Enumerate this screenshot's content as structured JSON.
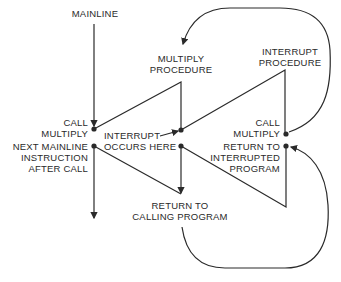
{
  "diagram": {
    "labels": {
      "mainline": "MAINLINE",
      "multiply_procedure": [
        "MULTIPLY",
        "PROCEDURE"
      ],
      "interrupt_procedure": [
        "INTERRUPT",
        "PROCEDURE"
      ],
      "call_multiply_left": [
        "CALL",
        "MULTIPLY"
      ],
      "call_multiply_right": [
        "CALL",
        "MULTIPLY"
      ],
      "interrupt_occurs": [
        "INTERRUPT",
        "OCCURS HERE"
      ],
      "next_mainline": [
        "NEXT MAINLINE",
        "INSTRUCTION",
        "AFTER CALL"
      ],
      "return_interrupted": [
        "RETURN TO",
        "INTERRUPTED",
        "PROGRAM"
      ],
      "return_calling": [
        "RETURN TO",
        "CALLING PROGRAM"
      ]
    },
    "colors": {
      "line": "#2a2a2a",
      "text": "#2a2a2a",
      "background": "#ffffff"
    }
  }
}
